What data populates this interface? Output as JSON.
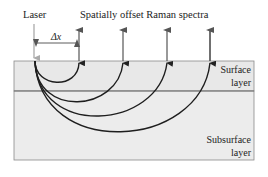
{
  "diagram": {
    "labels": {
      "laser": "Laser",
      "spectra": "Spatially offset Raman spectra",
      "offset": "Δx",
      "surface_line1": "Surface",
      "surface_line2": "layer",
      "subsurface_line1": "Subsurface",
      "subsurface_line2": "layer"
    },
    "colors": {
      "layer_fill": "#e8e8e8",
      "layer_border": "#8a8a8a",
      "arrow": "#555555",
      "curve": "#1e1e1e",
      "laser_arrow": "#b0b0b0"
    },
    "collection_points_count": 5
  }
}
